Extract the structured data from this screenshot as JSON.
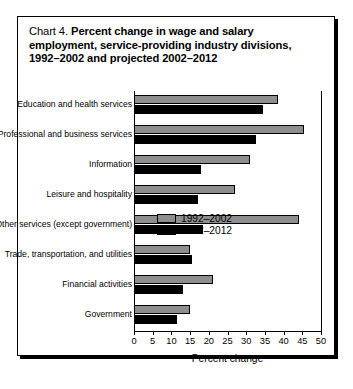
{
  "chart_data": {
    "type": "bar",
    "orientation": "horizontal",
    "title_lead": "Chart 4.",
    "title": "Percent change in wage and salary employment, service-providing industry divisions, 1992–2002 and projected 2002–2012",
    "title_line1": "Percent change in wage and salary",
    "title_line2": "employment, service-providing industry divisions,",
    "title_line3": "1992–2002 and projected 2002–2012",
    "xlabel": "Percent change",
    "ylabel": "",
    "xlim": [
      0,
      50
    ],
    "xticks": [
      0,
      5,
      10,
      15,
      20,
      25,
      30,
      35,
      40,
      45,
      50
    ],
    "grid": false,
    "legend_position": "bottom-right",
    "categories": [
      "Education and health services",
      "Professional and business services",
      "Information",
      "Leisure and hospitality",
      "Other services (except government)",
      "Trade, transportation, and utilities",
      "Financial activities",
      "Government"
    ],
    "series": [
      {
        "name": "1992–2002",
        "color": "#8e8e8e",
        "values": [
          38.5,
          45.5,
          31.0,
          27.0,
          44.0,
          15.0,
          21.0,
          15.0
        ]
      },
      {
        "name": "2002–2012",
        "color": "#000000",
        "values": [
          34.5,
          32.5,
          18.0,
          17.0,
          18.5,
          15.5,
          13.0,
          11.5
        ]
      }
    ]
  }
}
